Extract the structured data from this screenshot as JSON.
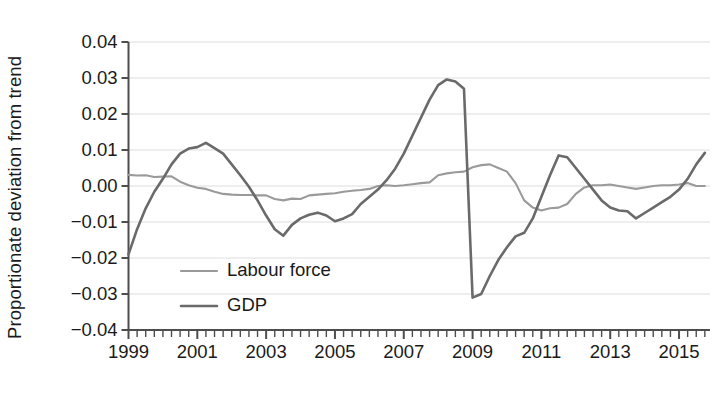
{
  "chart_data": {
    "type": "line",
    "title": "",
    "xlabel": "",
    "ylabel": "Proportionate deviation from trend",
    "ylim": [
      -0.04,
      0.04
    ],
    "yticks": [
      0.04,
      0.03,
      0.02,
      0.01,
      0.0,
      -0.01,
      -0.02,
      -0.03,
      -0.04
    ],
    "ytick_labels": [
      "0.04",
      "0.03",
      "0.02",
      "0.01",
      "0.00",
      "−0.01",
      "−0.02",
      "−0.03",
      "−0.04"
    ],
    "xlim": [
      1999.0,
      2015.9
    ],
    "xticks": [
      1999,
      2001,
      2003,
      2005,
      2007,
      2009,
      2011,
      2013,
      2015
    ],
    "xtick_labels": [
      "1999",
      "2001",
      "2003",
      "2005",
      "2007",
      "2009",
      "2011",
      "2013",
      "2015"
    ],
    "x_minor_tick_interval_years": 0.25,
    "grid": "horizontal",
    "legend_position": "inner-lower-left",
    "series": [
      {
        "name": "Labour force",
        "color": "#9a9a9a",
        "line_width": 2.1,
        "x": [
          1999.0,
          1999.25,
          1999.5,
          1999.75,
          2000.0,
          2000.25,
          2000.5,
          2000.75,
          2001.0,
          2001.25,
          2001.5,
          2001.75,
          2002.0,
          2002.25,
          2002.5,
          2002.75,
          2003.0,
          2003.25,
          2003.5,
          2003.75,
          2004.0,
          2004.25,
          2004.5,
          2004.75,
          2005.0,
          2005.25,
          2005.5,
          2005.75,
          2006.0,
          2006.25,
          2006.5,
          2006.75,
          2007.0,
          2007.25,
          2007.5,
          2007.75,
          2008.0,
          2008.25,
          2008.5,
          2008.75,
          2009.0,
          2009.25,
          2009.5,
          2009.75,
          2010.0,
          2010.25,
          2010.5,
          2010.75,
          2011.0,
          2011.25,
          2011.5,
          2011.75,
          2012.0,
          2012.25,
          2012.5,
          2012.75,
          2013.0,
          2013.25,
          2013.5,
          2013.75,
          2014.0,
          2014.25,
          2014.5,
          2014.75,
          2015.0,
          2015.25,
          2015.5,
          2015.75
        ],
        "y": [
          0.0031,
          0.0029,
          0.003,
          0.0025,
          0.0026,
          0.0027,
          0.0012,
          0.0002,
          -0.0005,
          -0.0008,
          -0.0016,
          -0.0022,
          -0.0024,
          -0.0025,
          -0.0025,
          -0.0026,
          -0.0026,
          -0.0036,
          -0.004,
          -0.0035,
          -0.0036,
          -0.0026,
          -0.0024,
          -0.0022,
          -0.002,
          -0.0016,
          -0.0013,
          -0.0011,
          -0.0008,
          0.0,
          0.0002,
          0.0,
          0.0002,
          0.0005,
          0.0008,
          0.001,
          0.003,
          0.0035,
          0.0038,
          0.004,
          0.0052,
          0.0058,
          0.006,
          0.005,
          0.004,
          0.0008,
          -0.004,
          -0.006,
          -0.0068,
          -0.0062,
          -0.006,
          -0.005,
          -0.0022,
          -0.0004,
          0.0002,
          0.0002,
          0.0004,
          0.0,
          -0.0004,
          -0.0008,
          -0.0004,
          0.0,
          0.0002,
          0.0002,
          0.0004,
          0.0008,
          0.0,
          0.0
        ]
      },
      {
        "name": "GDP",
        "color": "#6a6a6a",
        "line_width": 2.6,
        "x": [
          1999.0,
          1999.25,
          1999.5,
          1999.75,
          2000.0,
          2000.25,
          2000.5,
          2000.75,
          2001.0,
          2001.25,
          2001.5,
          2001.75,
          2002.0,
          2002.25,
          2002.5,
          2002.75,
          2003.0,
          2003.25,
          2003.5,
          2003.75,
          2004.0,
          2004.25,
          2004.5,
          2004.75,
          2005.0,
          2005.25,
          2005.5,
          2005.75,
          2006.0,
          2006.25,
          2006.5,
          2006.75,
          2007.0,
          2007.25,
          2007.5,
          2007.75,
          2008.0,
          2008.25,
          2008.5,
          2008.75,
          2009.0,
          2009.25,
          2009.5,
          2009.75,
          2010.0,
          2010.25,
          2010.5,
          2010.75,
          2011.0,
          2011.25,
          2011.5,
          2011.75,
          2012.0,
          2012.25,
          2012.5,
          2012.75,
          2013.0,
          2013.25,
          2013.5,
          2013.75,
          2014.0,
          2014.25,
          2014.5,
          2014.75,
          2015.0,
          2015.25,
          2015.5,
          2015.75
        ],
        "y": [
          -0.019,
          -0.012,
          -0.0062,
          -0.0016,
          0.002,
          0.006,
          0.009,
          0.0104,
          0.0108,
          0.012,
          0.0105,
          0.009,
          0.006,
          0.003,
          -0.0002,
          -0.004,
          -0.0082,
          -0.012,
          -0.0138,
          -0.0108,
          -0.009,
          -0.008,
          -0.0074,
          -0.0082,
          -0.0098,
          -0.009,
          -0.0078,
          -0.005,
          -0.003,
          -0.001,
          0.0016,
          0.0048,
          0.009,
          0.014,
          0.019,
          0.024,
          0.028,
          0.0296,
          0.029,
          0.027,
          -0.031,
          -0.03,
          -0.025,
          -0.0205,
          -0.017,
          -0.014,
          -0.013,
          -0.009,
          -0.003,
          0.003,
          0.0085,
          0.008,
          0.005,
          0.002,
          -0.001,
          -0.004,
          -0.006,
          -0.0068,
          -0.007,
          -0.009,
          -0.0075,
          -0.006,
          -0.0045,
          -0.003,
          -0.001,
          0.002,
          0.006,
          0.0092
        ]
      }
    ],
    "legend": [
      {
        "label": "Labour force",
        "color": "#9a9a9a"
      },
      {
        "label": "GDP",
        "color": "#6a6a6a"
      }
    ]
  },
  "style": {
    "background": "#ffffff",
    "axis_color": "#4d4d4d",
    "grid_color": "#e9e9e9",
    "text_color": "#1a1a1a"
  }
}
